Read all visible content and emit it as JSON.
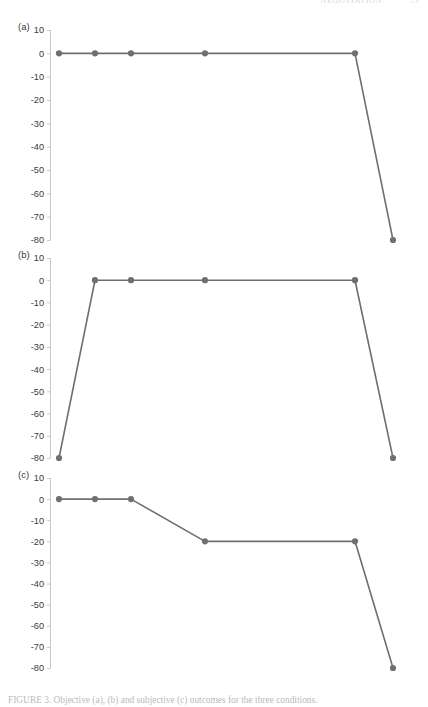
{
  "page": {
    "running_head_title": "NEGOTIATION",
    "running_head_page": "75",
    "background_color": "#ffffff"
  },
  "figure": {
    "caption_label": "FIGURE 3.",
    "caption_text": "Objective (a), (b) and subjective (c) outcomes for the three conditions."
  },
  "style": {
    "line_color": "#6f6f6f",
    "marker_color": "#6f6f6f",
    "axis_color": "#c9c9c9",
    "tick_label_color": "#3a3a3a"
  },
  "chart_data": [
    {
      "type": "line",
      "title": "(a)",
      "panel": "a",
      "xlabel": "",
      "ylabel": "",
      "ylim": [
        -85,
        10
      ],
      "yticks": [
        10,
        0,
        -10,
        -20,
        -30,
        -40,
        -50,
        -60,
        -70,
        -80
      ],
      "ytick_labels": [
        "10",
        "0",
        "-10",
        "-20",
        "-30",
        "-40",
        "-50",
        "-60",
        "-70",
        "-80"
      ],
      "grid": false,
      "legend": "none",
      "x": [
        0,
        1,
        2,
        4,
        8,
        9
      ],
      "values": [
        0,
        0,
        0,
        0,
        0,
        -80
      ],
      "markers": true
    },
    {
      "type": "line",
      "title": "(b)",
      "panel": "b",
      "xlabel": "",
      "ylabel": "",
      "ylim": [
        -85,
        10
      ],
      "yticks": [
        10,
        0,
        -10,
        -20,
        -30,
        -40,
        -50,
        -60,
        -70,
        -80
      ],
      "ytick_labels": [
        "10",
        "0",
        "-10",
        "-20",
        "-30",
        "-40",
        "-50",
        "-60",
        "-70",
        "-80"
      ],
      "grid": false,
      "legend": "none",
      "x": [
        0,
        1,
        2,
        4,
        8,
        9
      ],
      "values": [
        -80,
        0,
        0,
        0,
        0,
        -80
      ],
      "markers": true
    },
    {
      "type": "line",
      "title": "(c)",
      "panel": "c",
      "xlabel": "",
      "ylabel": "",
      "ylim": [
        -85,
        10
      ],
      "yticks": [
        10,
        0,
        -10,
        -20,
        -30,
        -40,
        -50,
        -60,
        -70,
        -80
      ],
      "ytick_labels": [
        "10",
        "0",
        "-10",
        "-20",
        "-30",
        "-40",
        "-50",
        "-60",
        "-70",
        "-80"
      ],
      "grid": false,
      "legend": "none",
      "x": [
        0,
        1,
        2,
        4,
        8,
        9
      ],
      "values": [
        0,
        0,
        0,
        -20,
        -20,
        -80
      ],
      "markers": true
    }
  ]
}
